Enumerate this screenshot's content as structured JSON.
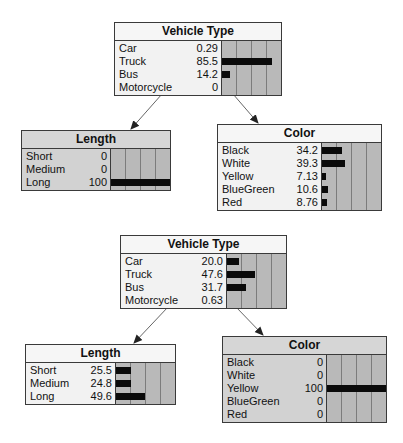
{
  "networks": [
    {
      "scenario": "Evidence: Length = Long",
      "vehicle_type": {
        "title": "Vehicle Type",
        "states": [
          {
            "label": "Car",
            "value": "0.29",
            "pct": 0.29
          },
          {
            "label": "Truck",
            "value": "85.5",
            "pct": 85.5
          },
          {
            "label": "Bus",
            "value": "14.2",
            "pct": 14.2
          },
          {
            "label": "Motorcycle",
            "value": "0",
            "pct": 0
          }
        ]
      },
      "length": {
        "title": "Length",
        "evidence": true,
        "states": [
          {
            "label": "Short",
            "value": "0",
            "pct": 0
          },
          {
            "label": "Medium",
            "value": "0",
            "pct": 0
          },
          {
            "label": "Long",
            "value": "100",
            "pct": 100
          }
        ]
      },
      "color": {
        "title": "Color",
        "states": [
          {
            "label": "Black",
            "value": "34.2",
            "pct": 34.2
          },
          {
            "label": "White",
            "value": "39.3",
            "pct": 39.3
          },
          {
            "label": "Yellow",
            "value": "7.13",
            "pct": 7.13
          },
          {
            "label": "BlueGreen",
            "value": "10.6",
            "pct": 10.6
          },
          {
            "label": "Red",
            "value": "8.76",
            "pct": 8.76
          }
        ]
      }
    },
    {
      "scenario": "Evidence: Color = Yellow",
      "vehicle_type": {
        "title": "Vehicle Type",
        "states": [
          {
            "label": "Car",
            "value": "20.0",
            "pct": 20.0
          },
          {
            "label": "Truck",
            "value": "47.6",
            "pct": 47.6
          },
          {
            "label": "Bus",
            "value": "31.7",
            "pct": 31.7
          },
          {
            "label": "Motorcycle",
            "value": "0.63",
            "pct": 0.63
          }
        ]
      },
      "length": {
        "title": "Length",
        "states": [
          {
            "label": "Short",
            "value": "25.5",
            "pct": 25.5
          },
          {
            "label": "Medium",
            "value": "24.8",
            "pct": 24.8
          },
          {
            "label": "Long",
            "value": "49.6",
            "pct": 49.6
          }
        ]
      },
      "color": {
        "title": "Color",
        "evidence": true,
        "states": [
          {
            "label": "Black",
            "value": "0",
            "pct": 0
          },
          {
            "label": "White",
            "value": "0",
            "pct": 0
          },
          {
            "label": "Yellow",
            "value": "100",
            "pct": 100
          },
          {
            "label": "BlueGreen",
            "value": "0",
            "pct": 0
          },
          {
            "label": "Red",
            "value": "0",
            "pct": 0
          }
        ]
      }
    }
  ],
  "colors": {
    "bar": "#0a0a0a",
    "bar_bg": "#b9b9b9",
    "evidence_bg": "#d2d2d2",
    "node_bg": "#f2f2f2",
    "border": "#3a3a3a"
  }
}
